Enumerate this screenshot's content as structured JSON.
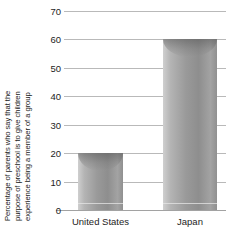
{
  "chart_data": {
    "type": "bar",
    "title": "",
    "subtitle": "",
    "xlabel": "",
    "ylabel_lines": [
      "Percentage of parents who say that the",
      "purpose of preschool is to give children",
      "experience being a member of a group"
    ],
    "ylabel": "Percentage of parents who say that the purpose of preschool is to give children experience being a member of a group",
    "categories": [
      "United States",
      "Japan"
    ],
    "values": [
      20,
      60
    ],
    "ylim": [
      0,
      70
    ],
    "ytick_labels": [
      "0",
      "10",
      "20",
      "30",
      "40",
      "50",
      "60",
      "70"
    ],
    "ytick_values": [
      0,
      10,
      20,
      30,
      40,
      50,
      60,
      70
    ],
    "grid": true,
    "legend": false,
    "legend_position": "none",
    "bar_style": "cylinder",
    "colors": {
      "bar_light": "#cfcfcf",
      "bar_mid": "#9a9a9a",
      "bar_dark": "#8e8e8e",
      "gridline": "#b9b9b9",
      "axis": "#a2a2a2",
      "text": "#1d1d1d",
      "background": "#ffffff"
    }
  }
}
